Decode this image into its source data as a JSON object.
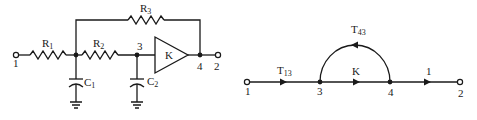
{
  "circuit": {
    "terminals": {
      "in": "1",
      "out": "2"
    },
    "resistors": [
      {
        "name": "R",
        "sub": "1"
      },
      {
        "name": "R",
        "sub": "2"
      },
      {
        "name": "R",
        "sub": "3"
      }
    ],
    "capacitors": [
      {
        "name": "C",
        "sub": "1"
      },
      {
        "name": "C",
        "sub": "2"
      }
    ],
    "amplifier": {
      "gain": "K"
    },
    "nodes": {
      "n3": "3",
      "n4": "4"
    }
  },
  "flow_graph": {
    "nodes": [
      "1",
      "3",
      "4",
      "2"
    ],
    "branches": [
      {
        "from": "1",
        "to": "3",
        "name": "T",
        "sub": "13"
      },
      {
        "from": "3",
        "to": "4",
        "name": "K",
        "sub": ""
      },
      {
        "from": "4",
        "to": "2",
        "name": "1",
        "sub": ""
      },
      {
        "from": "4",
        "to": "3",
        "name": "T",
        "sub": "43"
      }
    ]
  },
  "colors": {
    "ink": "#1a1a1a",
    "background": "#ffffff"
  }
}
